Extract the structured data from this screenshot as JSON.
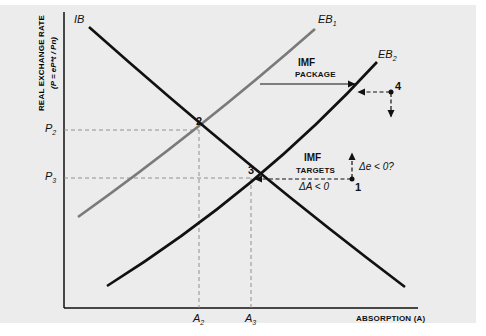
{
  "axes": {
    "y_title_line1": "REAL EXCHANGE RATE",
    "y_title_line2": "(P = eP*t / Pn)",
    "x_title": "ABSORPTION (A)",
    "y_ticks": [
      {
        "label": "P",
        "sub": "2"
      },
      {
        "label": "P",
        "sub": "3"
      }
    ],
    "x_ticks": [
      {
        "label": "A",
        "sub": "2"
      },
      {
        "label": "A",
        "sub": "3"
      }
    ]
  },
  "curves": {
    "ib": {
      "label": "IB"
    },
    "eb1": {
      "label": "EB",
      "sub": "1"
    },
    "eb2": {
      "label": "EB",
      "sub": "2"
    }
  },
  "points": [
    "1",
    "2",
    "3",
    "4"
  ],
  "annotations": {
    "imf_package_line1": "IMF",
    "imf_package_line2": "PACKAGE",
    "imf_targets_line1": "IMF",
    "imf_targets_line2": "TARGETS",
    "delta_a": "ΔA < 0",
    "delta_e": "Δe < 0?"
  },
  "colors": {
    "panel_bg": "#ececec",
    "ib": "#111111",
    "eb1": "#7a7a7a",
    "eb2": "#111111",
    "dashed_guides": "#888888"
  }
}
